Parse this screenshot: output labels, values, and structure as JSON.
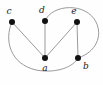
{
  "figure": {
    "background_color": "#fefefe",
    "width": 103,
    "height": 85
  },
  "chart_data": {
    "type": "diagram",
    "diagram_kind": "undirected-graph",
    "title": "",
    "vertex_color": "#111111",
    "edge_color": "#9a9a9a",
    "vertex_radius": 3,
    "nodes": [
      {
        "id": "c",
        "label": "c",
        "x": 12,
        "y": 22,
        "label_x": 9,
        "label_y": 14
      },
      {
        "id": "d",
        "label": "d",
        "x": 45,
        "y": 21,
        "label_x": 42,
        "label_y": 13
      },
      {
        "id": "e",
        "label": "e",
        "x": 77,
        "y": 22,
        "label_x": 74,
        "label_y": 14
      },
      {
        "id": "a",
        "label": "a",
        "x": 45,
        "y": 58,
        "label_x": 45,
        "label_y": 71
      },
      {
        "id": "b",
        "label": "b",
        "x": 78,
        "y": 58,
        "label_x": 86,
        "label_y": 69
      }
    ],
    "edges": [
      {
        "id": "edge-c-a",
        "source": "c",
        "target": "a",
        "shape": "straight",
        "path": "M 12 22 L 45 58"
      },
      {
        "id": "edge-d-a",
        "source": "d",
        "target": "a",
        "shape": "straight",
        "path": "M 45 21 L 45 58"
      },
      {
        "id": "edge-e-a",
        "source": "e",
        "target": "a",
        "shape": "straight",
        "path": "M 77 22 L 45 58"
      },
      {
        "id": "edge-e-b",
        "source": "e",
        "target": "b",
        "shape": "straight",
        "path": "M 77 22 L 78 58"
      },
      {
        "id": "edge-d-b-arc",
        "source": "d",
        "target": "b",
        "shape": "curved",
        "path": "M 45 21 C 52 4 86 2 96 22 C 103 36 96 52 78 58"
      },
      {
        "id": "edge-c-b-arc",
        "source": "c",
        "target": "b",
        "shape": "curved",
        "path": "M 12 22 C 4 40 10 64 36 70 C 58 74 74 66 78 58"
      }
    ],
    "node_count": 5,
    "edge_count": 6,
    "labels": [
      "a",
      "b",
      "c",
      "d",
      "e"
    ]
  }
}
